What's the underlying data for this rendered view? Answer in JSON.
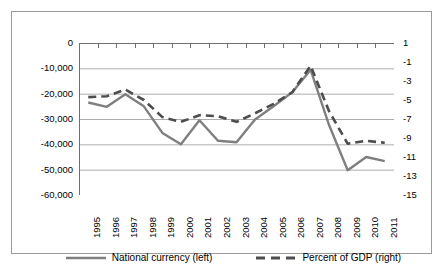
{
  "chart_data": {
    "type": "line",
    "title": "",
    "subtitle": "",
    "xlabel": "",
    "ylabel": "",
    "grid": true,
    "legend_position": "bottom",
    "categories": [
      "1995",
      "1996",
      "1997",
      "1998",
      "1999",
      "2000",
      "2001",
      "2002",
      "2003",
      "2004",
      "2005",
      "2006",
      "2007",
      "2008",
      "2009",
      "2010",
      "2011"
    ],
    "axes": {
      "left": {
        "label": "National currency",
        "ticks": [
          "0",
          "-10,000",
          "-20,000",
          "-30,000",
          "-40,000",
          "-50,000",
          "-60,000"
        ],
        "tick_values": [
          0,
          -10000,
          -20000,
          -30000,
          -40000,
          -50000,
          -60000
        ],
        "min": -60000,
        "max": 0
      },
      "right": {
        "label": "Percent of GDP",
        "ticks": [
          "1",
          "-1",
          "-3",
          "-5",
          "-7",
          "-9",
          "-11",
          "-13",
          "-15"
        ],
        "tick_values": [
          1,
          -1,
          -3,
          -5,
          -7,
          -9,
          -11,
          -13,
          -15
        ],
        "min": -15,
        "max": 1
      }
    },
    "series": [
      {
        "name": "National currency (left)",
        "axis": "left",
        "style": "solid",
        "color": "#7f7f7f",
        "values": [
          -23500,
          -25200,
          -20200,
          -25000,
          -35500,
          -40000,
          -30500,
          -38600,
          -39200,
          -30200,
          -25000,
          -19500,
          -10600,
          -32500,
          -50200,
          -45000,
          -46600
        ]
      },
      {
        "name": "Percent of GDP (right)",
        "axis": "right",
        "style": "dashed",
        "color": "#4d4d4d",
        "values": [
          -4.7,
          -4.6,
          -3.9,
          -5.0,
          -6.8,
          -7.3,
          -6.6,
          -6.7,
          -7.3,
          -6.4,
          -5.4,
          -4.2,
          -1.4,
          -6.2,
          -9.6,
          -9.3,
          -9.5
        ]
      }
    ]
  },
  "legend": {
    "items": [
      {
        "label": "National currency (left)",
        "style": "solid",
        "color": "#7f7f7f"
      },
      {
        "label": "Percent of GDP (right)",
        "style": "dashed",
        "color": "#4d4d4d"
      }
    ]
  },
  "artifact": {
    "text": ""
  }
}
